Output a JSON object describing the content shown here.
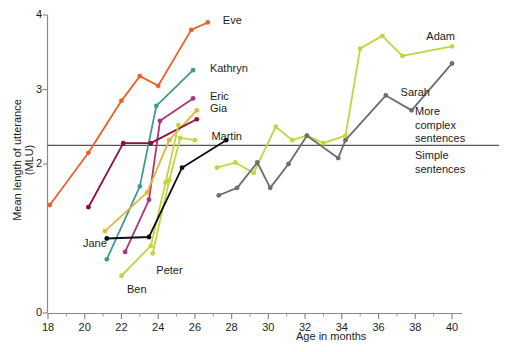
{
  "chart_data": {
    "type": "line",
    "title": "",
    "xlabel": "Age in months",
    "ylabel": "Mean length of utterance (MLU)",
    "xlim": [
      18,
      40
    ],
    "ylim": [
      0,
      4
    ],
    "xticks": [
      18,
      20,
      22,
      24,
      26,
      28,
      30,
      32,
      34,
      36,
      38,
      40
    ],
    "xminorticks": [
      19,
      21,
      23,
      25,
      27,
      29,
      31,
      33,
      35,
      37,
      39
    ],
    "yticks": [
      0,
      2,
      3,
      4
    ],
    "grid": false,
    "legend": "inline-end-labels",
    "threshold": {
      "value": 2.25,
      "above_label": "More\ncomplex\nsentences",
      "above_label_lines": [
        "More",
        "complex",
        "sentences"
      ],
      "below_label_lines": [
        "Simple",
        "sentences"
      ],
      "color": "#555555"
    },
    "series": [
      {
        "name": "Eve",
        "color": "#e8622a",
        "label_x": 27.3,
        "label_y": 3.9,
        "points": [
          [
            18.1,
            1.45
          ],
          [
            20.2,
            2.15
          ],
          [
            22.0,
            2.85
          ],
          [
            23.0,
            3.18
          ],
          [
            24.0,
            3.05
          ],
          [
            25.8,
            3.8
          ],
          [
            26.7,
            3.9
          ]
        ]
      },
      {
        "name": "Kathryn",
        "color": "#3f9b91",
        "label_x": 26.6,
        "label_y": 3.26,
        "points": [
          [
            21.2,
            0.72
          ],
          [
            23.0,
            1.7
          ],
          [
            23.9,
            2.78
          ],
          [
            25.9,
            3.26
          ]
        ]
      },
      {
        "name": "Eric",
        "color": "#a8367c",
        "label_x": 26.6,
        "label_y": 2.88,
        "points": [
          [
            22.2,
            0.82
          ],
          [
            23.5,
            1.52
          ],
          [
            24.1,
            2.58
          ],
          [
            25.9,
            2.88
          ]
        ]
      },
      {
        "name": "Gia",
        "color": "#e0b63c",
        "label_x": 26.6,
        "label_y": 2.72,
        "points": [
          [
            21.1,
            1.1
          ],
          [
            23.4,
            1.62
          ],
          [
            24.6,
            2.32
          ],
          [
            26.1,
            2.72
          ]
        ]
      },
      {
        "name": "Jane",
        "color": "#8d1038",
        "label_x": 20.0,
        "label_y": 1.0,
        "points": [
          [
            20.2,
            1.42
          ],
          [
            22.1,
            2.28
          ],
          [
            23.6,
            2.28
          ],
          [
            26.1,
            2.6
          ]
        ]
      },
      {
        "name": "Ben",
        "color": "#c3d43f",
        "label_x": 22.4,
        "label_y": 0.38,
        "points": [
          [
            22.0,
            0.5
          ],
          [
            23.6,
            0.9
          ],
          [
            24.4,
            1.75
          ],
          [
            25.1,
            2.52
          ]
        ]
      },
      {
        "name": "Peter",
        "color": "#c3d43f",
        "label_x": 24.0,
        "label_y": 0.62,
        "points": [
          [
            23.7,
            0.8
          ],
          [
            24.6,
            1.78
          ],
          [
            25.2,
            2.35
          ],
          [
            26.0,
            2.32
          ]
        ]
      },
      {
        "name": "Martin",
        "color": "#0d0d0d",
        "label_x": 27.0,
        "label_y": 2.42,
        "points": [
          [
            21.2,
            1.0
          ],
          [
            23.5,
            1.02
          ],
          [
            25.3,
            1.95
          ],
          [
            27.7,
            2.32
          ]
        ]
      },
      {
        "name": "Adam",
        "color": "#c3d43f",
        "label_x": 40.2,
        "label_y": 3.72,
        "points": [
          [
            27.2,
            1.95
          ],
          [
            28.2,
            2.02
          ],
          [
            29.2,
            1.88
          ],
          [
            30.4,
            2.5
          ],
          [
            31.3,
            2.32
          ],
          [
            32.1,
            2.38
          ],
          [
            33.0,
            2.28
          ],
          [
            34.2,
            2.38
          ],
          [
            35.0,
            3.55
          ],
          [
            36.2,
            3.72
          ],
          [
            37.3,
            3.45
          ],
          [
            40.0,
            3.58
          ]
        ]
      },
      {
        "name": "Sarah",
        "color": "#6d6d6d",
        "label_x": 37.4,
        "label_y": 3.02,
        "points": [
          [
            27.3,
            1.58
          ],
          [
            28.3,
            1.68
          ],
          [
            29.4,
            2.02
          ],
          [
            30.1,
            1.68
          ],
          [
            31.1,
            2.0
          ],
          [
            32.1,
            2.38
          ],
          [
            33.8,
            2.08
          ],
          [
            34.2,
            2.32
          ],
          [
            36.4,
            2.92
          ],
          [
            37.8,
            2.72
          ],
          [
            40.0,
            3.35
          ]
        ]
      }
    ]
  },
  "axis": {
    "x_tick_labels": [
      "18",
      "20",
      "22",
      "24",
      "26",
      "28",
      "30",
      "32",
      "34",
      "36",
      "38",
      "40"
    ],
    "y_tick_labels": [
      "0",
      "2",
      "3",
      "4"
    ],
    "x_title": "Age in months",
    "y_title": "Mean length of utterance (MLU)"
  }
}
